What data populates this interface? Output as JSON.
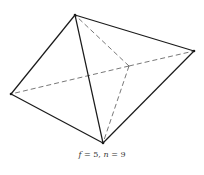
{
  "figure": {
    "line_color": "#1a1a1a",
    "hidden_line_color": "#555555"
  },
  "caption": {
    "var1": "f",
    "eq1": " = 5, ",
    "var2": "n",
    "eq2": " = 9"
  }
}
